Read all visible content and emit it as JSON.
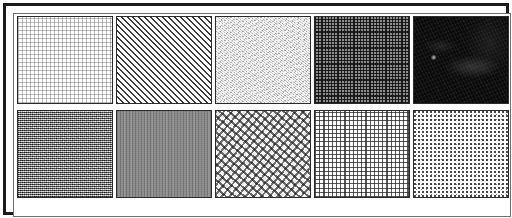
{
  "figure": {
    "frame_color": "#1b1b1b",
    "background_color": "#ffffff",
    "grid": {
      "rows": 2,
      "columns": 5,
      "tile_count": 10
    }
  },
  "tiles": [
    {
      "index": 1,
      "row": 1,
      "column": 1,
      "name": "fine-dot-grid",
      "label": "Fine dot grid",
      "pattern": "regular fine square dot lattice",
      "mean_tone": "very light",
      "base_color": "#ffffff",
      "mark_color": "#787878"
    },
    {
      "index": 2,
      "row": 1,
      "column": 2,
      "name": "diagonal-hatch",
      "label": "Diagonal hatch",
      "pattern": "45 degree parallel diagonal lines, lower-left to upper-right",
      "mean_tone": "light",
      "base_color": "#ffffff",
      "mark_color": "#3c3c3c"
    },
    {
      "index": 3,
      "row": 1,
      "column": 3,
      "name": "light-grain",
      "label": "Light grain",
      "pattern": "fine isotropic grain, low contrast",
      "mean_tone": "light gray",
      "base_color": "#d4d4d4",
      "mark_color": "#6e6e6e"
    },
    {
      "index": 4,
      "row": 1,
      "column": 4,
      "name": "dark-crosshatch",
      "label": "Dark crosshatch",
      "pattern": "dense orthogonal crosshatch lattice",
      "mean_tone": "medium dark",
      "base_color": "#8d8d8d",
      "mark_color": "#141414"
    },
    {
      "index": 5,
      "row": 1,
      "column": 5,
      "name": "near-black-mottle",
      "label": "Near-black mottle",
      "pattern": "very dark mottled surface with faint diagonal streak and bright speck",
      "mean_tone": "near black",
      "base_color": "#0a0a0a",
      "mark_color": "#6e6e6e"
    },
    {
      "index": 6,
      "row": 2,
      "column": 1,
      "name": "salt-pepper-noise",
      "label": "Salt and pepper noise",
      "pattern": "high contrast random binary noise",
      "mean_tone": "medium",
      "base_color": "#9a9a9a",
      "mark_color": "#0f0f0f"
    },
    {
      "index": 7,
      "row": 2,
      "column": 2,
      "name": "gray-striation",
      "label": "Gray striation",
      "pattern": "uniform mid gray with fine vertical striations",
      "mean_tone": "medium gray",
      "base_color": "#8a8a8a",
      "mark_color": "#3c3c3c"
    },
    {
      "index": 8,
      "row": 2,
      "column": 3,
      "name": "coarse-blob-speckle",
      "label": "Coarse blob speckle",
      "pattern": "coarse irregular blobs, high contrast",
      "mean_tone": "light medium",
      "base_color": "#e8e8e8",
      "mark_color": "#191919"
    },
    {
      "index": 9,
      "row": 2,
      "column": 4,
      "name": "light-crosshatch",
      "label": "Light crosshatch",
      "pattern": "regular orthogonal grid of thin lines on white",
      "mean_tone": "light medium",
      "base_color": "#ffffff",
      "mark_color": "#282828"
    },
    {
      "index": 10,
      "row": 2,
      "column": 5,
      "name": "sparse-dots",
      "label": "Sparse dots",
      "pattern": "sparse small dark dots scattered on white",
      "mean_tone": "very light",
      "base_color": "#ffffff",
      "mark_color": "#282828"
    }
  ]
}
